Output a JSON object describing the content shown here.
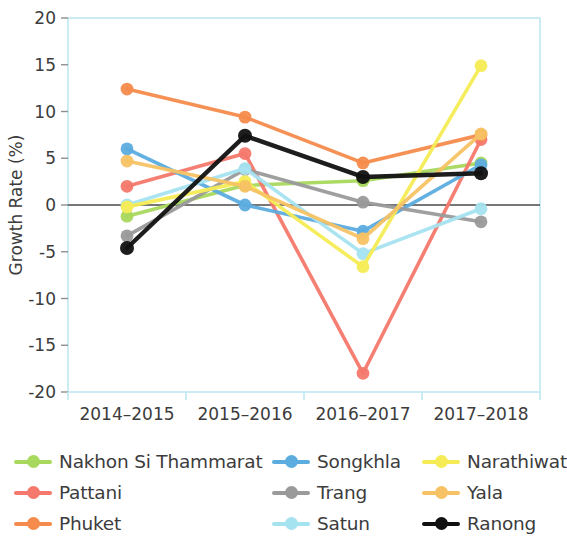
{
  "chart_data": {
    "type": "line",
    "title": "",
    "xlabel": "",
    "ylabel": "Growth Rate (%)",
    "categories": [
      "2014–2015",
      "2015–2016",
      "2016–2017",
      "2017–2018"
    ],
    "ylim": [
      -20,
      20
    ],
    "yticks": [
      -20,
      -15,
      -10,
      -5,
      0,
      5,
      10,
      15,
      20
    ],
    "ytick_labels": [
      "-20",
      "-15",
      "-10",
      "-5",
      "0",
      "5",
      "10",
      "15",
      "20"
    ],
    "grid": false,
    "legend_position": "bottom",
    "legend_columns": 3,
    "zero_line": true,
    "series": [
      {
        "name": "Nakhon Si Thammarat",
        "color": "#a8d85c",
        "values": [
          -1.2,
          2.1,
          2.6,
          4.5
        ]
      },
      {
        "name": "Pattani",
        "color": "#f4786b",
        "values": [
          2.0,
          5.5,
          -18.0,
          7.0
        ]
      },
      {
        "name": "Phuket",
        "color": "#f58b4c",
        "values": [
          12.4,
          9.4,
          4.5,
          7.5
        ]
      },
      {
        "name": "Songkhla",
        "color": "#5cacdf",
        "values": [
          6.0,
          0.0,
          -2.8,
          4.3
        ]
      },
      {
        "name": "Trang",
        "color": "#9a9a9a",
        "values": [
          -3.3,
          3.8,
          0.3,
          -1.8
        ]
      },
      {
        "name": "Satun",
        "color": "#a6e3f0",
        "values": [
          0.0,
          3.9,
          -5.2,
          -0.4
        ]
      },
      {
        "name": "Narathiwat",
        "color": "#f5ec55",
        "values": [
          -0.2,
          2.5,
          -6.6,
          14.9
        ]
      },
      {
        "name": "Yala",
        "color": "#f7c263",
        "values": [
          4.7,
          2.0,
          -3.6,
          7.6
        ]
      },
      {
        "name": "Ranong",
        "color": "#111111",
        "values": [
          -4.6,
          7.4,
          3.0,
          3.4
        ]
      }
    ]
  },
  "legend": {
    "items": [
      {
        "label": "Nakhon Si Thammarat"
      },
      {
        "label": "Songkhla"
      },
      {
        "label": "Narathiwat"
      },
      {
        "label": "Pattani"
      },
      {
        "label": "Trang"
      },
      {
        "label": "Yala"
      },
      {
        "label": "Phuket"
      },
      {
        "label": "Satun"
      },
      {
        "label": "Ranong"
      }
    ]
  }
}
